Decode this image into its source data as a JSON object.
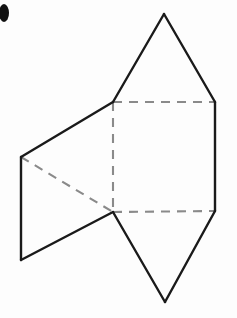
{
  "figure": {
    "title": "Net of a triangular prism",
    "canvas": {
      "width": 237,
      "height": 318
    },
    "colors": {
      "background": "#fdfdfd",
      "solid_line": "#1a1a1a",
      "hidden_line": "#8a8a8a",
      "mark": "#111111"
    },
    "line_styles": {
      "solid_label": "solid",
      "dashed_label": "dashed"
    },
    "points": {
      "top_apex": {
        "label": "top-apex",
        "x": 164,
        "y": 14
      },
      "square_top_left": {
        "label": "square-top-left",
        "x": 113,
        "y": 102
      },
      "square_top_right": {
        "label": "square-top-right",
        "x": 215,
        "y": 102
      },
      "square_bottom_left": {
        "label": "square-bottom-left",
        "x": 113,
        "y": 212
      },
      "square_bottom_right": {
        "label": "square-bottom-right",
        "x": 215,
        "y": 211
      },
      "bottom_apex": {
        "label": "bottom-apex",
        "x": 165,
        "y": 302
      },
      "left_top": {
        "label": "left-panel-top",
        "x": 21,
        "y": 157
      },
      "left_bottom": {
        "label": "left-panel-bottom",
        "x": 21,
        "y": 260
      }
    },
    "edges": {
      "top_triangle_left": {
        "name": "top-triangle-left-edge",
        "style": "solid",
        "d": "M 113 102 L 164 14"
      },
      "top_triangle_right": {
        "name": "top-triangle-right-edge",
        "style": "solid",
        "d": "M 164 14 L 215 102"
      },
      "square_right": {
        "name": "square-right-edge",
        "style": "solid",
        "d": "M 215 102 L 215 211"
      },
      "bottom_triangle_right": {
        "name": "bottom-triangle-right-edge",
        "style": "solid",
        "d": "M 215 211 L 165 302"
      },
      "bottom_triangle_left": {
        "name": "bottom-triangle-left-edge",
        "style": "solid",
        "d": "M 165 302 L 113 212"
      },
      "left_panel_top": {
        "name": "left-panel-top-edge",
        "style": "solid",
        "d": "M 113 102 L 21 157"
      },
      "left_panel_side": {
        "name": "left-panel-side-edge",
        "style": "solid",
        "d": "M 21 157 L 21 260"
      },
      "left_panel_bottom": {
        "name": "left-panel-bottom-edge",
        "style": "solid",
        "d": "M 21 260 L 113 212"
      },
      "square_top": {
        "name": "square-top-fold-line",
        "style": "dashed",
        "d": "M 113 102 L 215 102"
      },
      "square_left": {
        "name": "square-left-fold-line",
        "style": "dashed",
        "d": "M 113 102 L 113 212"
      },
      "square_bottom": {
        "name": "square-bottom-fold-line",
        "style": "dashed",
        "d": "M 113 212 L 215 211"
      },
      "left_panel_diagonal": {
        "name": "left-panel-diagonal-fold-line",
        "style": "dashed",
        "d": "M 21 157 L 113 212"
      }
    },
    "corner_mark": {
      "name": "page-edge-mark",
      "cx": 4,
      "cy": 13,
      "rx": 5,
      "ry": 9
    }
  }
}
